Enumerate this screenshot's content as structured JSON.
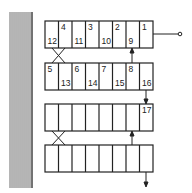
{
  "diagram": {
    "rows": [
      {
        "cells": [
          {
            "top": "",
            "bottom": "12"
          },
          {
            "top": "4",
            "bottom": ""
          },
          {
            "top": "",
            "bottom": "11"
          },
          {
            "top": "3",
            "bottom": ""
          },
          {
            "top": "",
            "bottom": "10"
          },
          {
            "top": "2",
            "bottom": ""
          },
          {
            "top": "",
            "bottom": "9"
          },
          {
            "top": "1",
            "bottom": ""
          }
        ]
      },
      {
        "cells": [
          {
            "top": "5",
            "bottom": ""
          },
          {
            "top": "",
            "bottom": "13"
          },
          {
            "top": "6",
            "bottom": ""
          },
          {
            "top": "",
            "bottom": "14"
          },
          {
            "top": "7",
            "bottom": ""
          },
          {
            "top": "",
            "bottom": "15"
          },
          {
            "top": "8",
            "bottom": ""
          },
          {
            "top": "",
            "bottom": "16"
          }
        ]
      },
      {
        "cells": [
          {
            "top": "",
            "bottom": ""
          },
          {
            "top": "",
            "bottom": ""
          },
          {
            "top": "",
            "bottom": ""
          },
          {
            "top": "",
            "bottom": ""
          },
          {
            "top": "",
            "bottom": ""
          },
          {
            "top": "",
            "bottom": ""
          },
          {
            "top": "",
            "bottom": ""
          },
          {
            "top": "17",
            "bottom": ""
          }
        ]
      },
      {
        "cells": [
          {
            "top": "",
            "bottom": ""
          },
          {
            "top": "",
            "bottom": ""
          },
          {
            "top": "",
            "bottom": ""
          },
          {
            "top": "",
            "bottom": ""
          },
          {
            "top": "",
            "bottom": ""
          },
          {
            "top": "",
            "bottom": ""
          },
          {
            "top": "",
            "bottom": ""
          },
          {
            "top": "",
            "bottom": ""
          }
        ]
      }
    ]
  }
}
